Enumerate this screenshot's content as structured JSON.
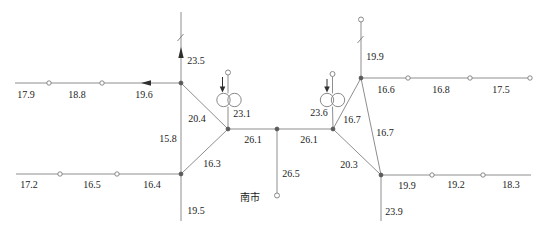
{
  "diagram": {
    "width": 548,
    "height": 236,
    "background": "#ffffff",
    "line_color": "#8e8e8e",
    "symbol_stroke": "#7d7d7d",
    "node_fill": "#ffffff",
    "junction_fill": "#5a5a5a",
    "arrow_fill": "#2f2f2f",
    "text_color": "#1c1c1c",
    "station_label": "南市",
    "labels": [
      {
        "text": "17.9",
        "x": 26,
        "y": 94
      },
      {
        "text": "18.8",
        "x": 77,
        "y": 94
      },
      {
        "text": "19.6",
        "x": 144,
        "y": 94
      },
      {
        "text": "23.5",
        "x": 196,
        "y": 60
      },
      {
        "text": "17.2",
        "x": 29,
        "y": 184
      },
      {
        "text": "16.5",
        "x": 92,
        "y": 184
      },
      {
        "text": "16.4",
        "x": 152,
        "y": 184
      },
      {
        "text": "19.5",
        "x": 196,
        "y": 210
      },
      {
        "text": "15.8",
        "x": 168,
        "y": 138
      },
      {
        "text": "20.4",
        "x": 197,
        "y": 118
      },
      {
        "text": "16.3",
        "x": 212,
        "y": 163
      },
      {
        "text": "23.1",
        "x": 242,
        "y": 113
      },
      {
        "text": "26.1",
        "x": 253,
        "y": 139
      },
      {
        "text": "26.1",
        "x": 309,
        "y": 139
      },
      {
        "text": "26.5",
        "x": 291,
        "y": 173
      },
      {
        "text": "南市",
        "x": 250,
        "y": 197,
        "cjk": true,
        "name": "station-label"
      },
      {
        "text": "23.6",
        "x": 319,
        "y": 112
      },
      {
        "text": "16.7",
        "x": 352,
        "y": 119
      },
      {
        "text": "16.7",
        "x": 385,
        "y": 132
      },
      {
        "text": "20.3",
        "x": 349,
        "y": 164
      },
      {
        "text": "19.9",
        "x": 375,
        "y": 56
      },
      {
        "text": "16.6",
        "x": 386,
        "y": 89
      },
      {
        "text": "16.8",
        "x": 441,
        "y": 89
      },
      {
        "text": "17.5",
        "x": 501,
        "y": 89
      },
      {
        "text": "19.9",
        "x": 407,
        "y": 185
      },
      {
        "text": "19.2",
        "x": 456,
        "y": 184
      },
      {
        "text": "18.3",
        "x": 511,
        "y": 184
      },
      {
        "text": "23.9",
        "x": 394,
        "y": 211
      }
    ],
    "segments": [
      {
        "x1": 15,
        "y1": 83,
        "x2": 181,
        "y2": 83
      },
      {
        "x1": 181,
        "y1": 12,
        "x2": 181,
        "y2": 83
      },
      {
        "x1": 181,
        "y1": 83,
        "x2": 181,
        "y2": 174
      },
      {
        "x1": 181,
        "y1": 174,
        "x2": 181,
        "y2": 221
      },
      {
        "x1": 16,
        "y1": 174,
        "x2": 181,
        "y2": 174
      },
      {
        "x1": 181,
        "y1": 83,
        "x2": 228,
        "y2": 129
      },
      {
        "x1": 181,
        "y1": 174,
        "x2": 228,
        "y2": 129
      },
      {
        "x1": 228,
        "y1": 129,
        "x2": 277,
        "y2": 129
      },
      {
        "x1": 277,
        "y1": 129,
        "x2": 333,
        "y2": 129
      },
      {
        "x1": 277,
        "y1": 129,
        "x2": 277,
        "y2": 193
      },
      {
        "x1": 333,
        "y1": 129,
        "x2": 361,
        "y2": 78
      },
      {
        "x1": 333,
        "y1": 129,
        "x2": 381,
        "y2": 175
      },
      {
        "x1": 361,
        "y1": 78,
        "x2": 381,
        "y2": 175
      },
      {
        "x1": 361,
        "y1": 22,
        "x2": 361,
        "y2": 78
      },
      {
        "x1": 361,
        "y1": 78,
        "x2": 528,
        "y2": 78
      },
      {
        "x1": 381,
        "y1": 175,
        "x2": 531,
        "y2": 175
      },
      {
        "x1": 381,
        "y1": 175,
        "x2": 381,
        "y2": 221
      },
      {
        "x1": 228,
        "y1": 75,
        "x2": 228,
        "y2": 93.4
      },
      {
        "x1": 228,
        "y1": 106.6,
        "x2": 228,
        "y2": 129
      },
      {
        "x1": 332.5,
        "y1": 76.5,
        "x2": 332.5,
        "y2": 93.4
      },
      {
        "x1": 332.5,
        "y1": 106.6,
        "x2": 333,
        "y2": 129
      }
    ],
    "junction_nodes": [
      {
        "x": 181,
        "y": 83
      },
      {
        "x": 181,
        "y": 174
      },
      {
        "x": 228,
        "y": 129
      },
      {
        "x": 277,
        "y": 129
      },
      {
        "x": 333,
        "y": 129
      },
      {
        "x": 361,
        "y": 78
      },
      {
        "x": 381,
        "y": 175
      }
    ],
    "pass_nodes": [
      {
        "x": 49,
        "y": 83
      },
      {
        "x": 102,
        "y": 83
      },
      {
        "x": 60,
        "y": 174
      },
      {
        "x": 117,
        "y": 174
      },
      {
        "x": 408,
        "y": 78
      },
      {
        "x": 470,
        "y": 78
      },
      {
        "x": 530,
        "y": 78
      },
      {
        "x": 432,
        "y": 175
      },
      {
        "x": 483,
        "y": 175
      }
    ],
    "terminal_nodes": [
      {
        "x": 228,
        "y": 72.5
      },
      {
        "x": 332.5,
        "y": 74
      },
      {
        "x": 361,
        "y": 19.5
      },
      {
        "x": 277,
        "y": 195.5
      }
    ],
    "transformer_symbols": [
      {
        "cx1": 223.5,
        "cx2": 234.5,
        "cy": 100,
        "r": 6.7
      },
      {
        "cx1": 327,
        "cx2": 338,
        "cy": 100,
        "r": 6.7
      }
    ],
    "load_arrows": [
      {
        "x": 222.5,
        "y1": 77,
        "y2": 87,
        "tip": 92.5,
        "hw": 2.8
      },
      {
        "x": 327,
        "y1": 79,
        "y2": 87,
        "tip": 92.5,
        "hw": 2.8
      }
    ],
    "flow_arrows": [
      {
        "points": "141,83 151,80.3 151,85.7",
        "dir": "left"
      },
      {
        "points": "181,47 178.3,58 183.7,58",
        "dir": "up"
      }
    ],
    "break_marks": [
      {
        "x1": 177.5,
        "y1": 41,
        "x2": 183.5,
        "y2": 34
      },
      {
        "x1": 357.5,
        "y1": 43,
        "x2": 363.5,
        "y2": 36
      }
    ]
  }
}
